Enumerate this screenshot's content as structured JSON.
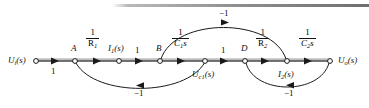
{
  "figure": {
    "type": "signal-flow-graph",
    "title": "",
    "top_rule": "decorative-horizontal-rule"
  },
  "nodes": [
    {
      "id": "n0",
      "label": "U",
      "sub": "i",
      "suffix": "(s)",
      "x": 36,
      "y": 61,
      "label_pos": "left"
    },
    {
      "id": "nA",
      "label": "A",
      "sub": "",
      "suffix": "",
      "x": 75,
      "y": 61,
      "label_pos": "above"
    },
    {
      "id": "n1",
      "label": "I",
      "sub": "1",
      "suffix": "(s)",
      "x": 119,
      "y": 61,
      "label_pos": "above"
    },
    {
      "id": "nB",
      "label": "B",
      "sub": "",
      "suffix": "",
      "x": 160,
      "y": 61,
      "label_pos": "above"
    },
    {
      "id": "n2",
      "label": "U",
      "sub": "c1",
      "suffix": "(s)",
      "x": 205,
      "y": 61,
      "label_pos": "below"
    },
    {
      "id": "nD",
      "label": "D",
      "sub": "",
      "suffix": "",
      "x": 245,
      "y": 61,
      "label_pos": "above"
    },
    {
      "id": "n3",
      "label": "I",
      "sub": "2",
      "suffix": "(s)",
      "x": 287,
      "y": 61,
      "label_pos": "below"
    },
    {
      "id": "n4",
      "label": "U",
      "sub": "o",
      "suffix": "(s)",
      "x": 330,
      "y": 61,
      "label_pos": "right"
    }
  ],
  "node_labels": {
    "input": {
      "text": "U",
      "sub": "i",
      "suffix": "(s)"
    },
    "A": {
      "text": "A"
    },
    "i1": {
      "text": "I",
      "sub": "1",
      "suffix": "(s)"
    },
    "B": {
      "text": "B"
    },
    "uc1": {
      "text": "U",
      "sub": "c1",
      "suffix": "(s)"
    },
    "D": {
      "text": "D"
    },
    "i2": {
      "text": "I",
      "sub": "2",
      "suffix": "(s)"
    },
    "output": {
      "text": "U",
      "sub": "o",
      "suffix": "(s)"
    }
  },
  "edges": [
    {
      "from": "input",
      "to": "A",
      "gain": "1",
      "kind": "plain",
      "path": "forward-straight",
      "label_pos": "below"
    },
    {
      "from": "A",
      "to": "i1",
      "gain": "1/R1",
      "kind": "fraction",
      "path": "forward-straight",
      "label_pos": "above"
    },
    {
      "from": "i1",
      "to": "B",
      "gain": "1",
      "kind": "plain",
      "path": "forward-straight",
      "label_pos": "above"
    },
    {
      "from": "B",
      "to": "uc1",
      "gain": "1/C1s",
      "kind": "fraction",
      "path": "forward-straight",
      "label_pos": "above"
    },
    {
      "from": "uc1",
      "to": "D",
      "gain": "1",
      "kind": "plain",
      "path": "forward-straight",
      "label_pos": "above"
    },
    {
      "from": "D",
      "to": "i2",
      "gain": "1/R2",
      "kind": "fraction",
      "path": "forward-straight",
      "label_pos": "above"
    },
    {
      "from": "i2",
      "to": "output",
      "gain": "1/C2s",
      "kind": "fraction",
      "path": "forward-straight",
      "label_pos": "above"
    },
    {
      "from": "uc1",
      "to": "A",
      "gain": "-1",
      "kind": "plain",
      "path": "feedback-lower-arc",
      "label_pos": "below"
    },
    {
      "from": "i2",
      "to": "B",
      "gain": "-1",
      "kind": "plain",
      "path": "feedback-upper-arc",
      "label_pos": "above"
    },
    {
      "from": "output",
      "to": "D",
      "gain": "-1",
      "kind": "plain",
      "path": "feedback-lower-arc",
      "label_pos": "below"
    }
  ],
  "gain_labels": {
    "g1": {
      "text": "1"
    },
    "g2": {
      "num": "1",
      "den": "R",
      "den_sub": "1"
    },
    "g3": {
      "text": "1"
    },
    "g4": {
      "num": "1",
      "den": "C",
      "den_sub": "1",
      "den_tail": "s"
    },
    "g5": {
      "text": "1"
    },
    "g6": {
      "num": "1",
      "den": "R",
      "den_sub": "2"
    },
    "g7": {
      "num": "1",
      "den": "C",
      "den_sub": "2",
      "den_tail": "s"
    },
    "fb1": {
      "text": "−1"
    },
    "fb2": {
      "text": "−1"
    },
    "fb3": {
      "text": "−1"
    }
  },
  "colors": {
    "line": "#1a1a1a",
    "main_path_highlight": "#9a9a9a",
    "node_fill": "#ffffff",
    "text": "#111111",
    "rule": "#8d8d8d"
  }
}
